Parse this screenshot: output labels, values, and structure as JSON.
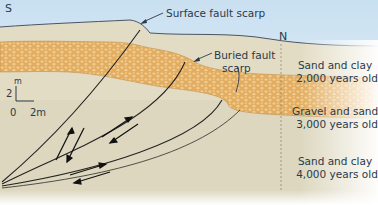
{
  "diagram": {
    "directions": {
      "left": "S",
      "right": "N"
    },
    "callouts": {
      "surface": "Surface fault scarp",
      "buried_line1": "Buried fault",
      "buried_line2": "scarp"
    },
    "layers": [
      {
        "name": "Sand and clay",
        "age": "2,000 years old",
        "color": "#e3dcc4"
      },
      {
        "name": "Gravel and sand",
        "age": "3,000 years old",
        "color": "#e8b56a"
      },
      {
        "name": "Sand and clay",
        "age": "4,000 years old",
        "color": "#ddd7bf"
      }
    ],
    "scale": {
      "unit_label": "m",
      "vertical_value": "2",
      "origin": "0",
      "horizontal_value": "2m"
    },
    "colors": {
      "sky": "#dbeaf5",
      "ink": "#2b3a4a",
      "fault": "#222222"
    }
  }
}
